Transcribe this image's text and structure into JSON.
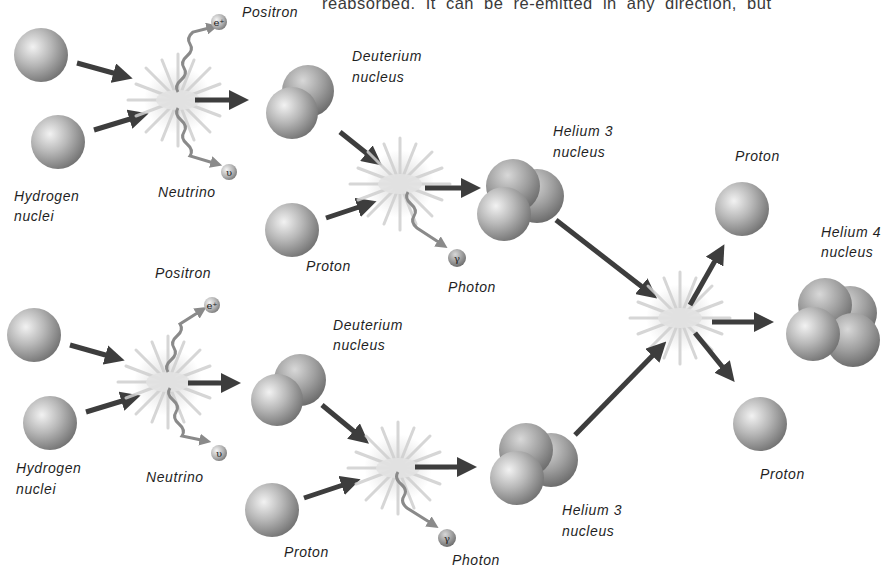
{
  "header_text": "reabsorbed. It can be re-emitted in any direction, but",
  "colors": {
    "sphere_light": "#e8e8e8",
    "sphere_mid": "#a9a9a9",
    "sphere_dark": "#6e6e6e",
    "arrow": "#3d3d3d",
    "wavy_arrow": "#8a8a8a",
    "burst": "#c9c9c9",
    "background": "#ffffff"
  },
  "top_chain": {
    "hydrogen_label_1": "Hydrogen",
    "hydrogen_label_2": "nuclei",
    "positron_label": "Positron",
    "positron_symbol": "e⁺",
    "neutrino_label": "Neutrino",
    "neutrino_symbol": "υ",
    "deuterium_label_1": "Deuterium",
    "deuterium_label_2": "nucleus",
    "proton_label": "Proton",
    "photon_label": "Photon",
    "photon_symbol": "γ",
    "helium3_label_1": "Helium 3",
    "helium3_label_2": "nucleus"
  },
  "bottom_chain": {
    "hydrogen_label_1": "Hydrogen",
    "hydrogen_label_2": "nuclei",
    "positron_label": "Positron",
    "positron_symbol": "e⁺",
    "neutrino_label": "Neutrino",
    "neutrino_symbol": "υ",
    "deuterium_label_1": "Deuterium",
    "deuterium_label_2": "nucleus",
    "proton_label": "Proton",
    "photon_label": "Photon",
    "photon_symbol": "γ",
    "helium3_label_1": "Helium 3",
    "helium3_label_2": "nucleus"
  },
  "final_stage": {
    "proton_top_label": "Proton",
    "proton_bottom_label": "Proton",
    "helium4_label_1": "Helium 4",
    "helium4_label_2": "nucleus"
  }
}
